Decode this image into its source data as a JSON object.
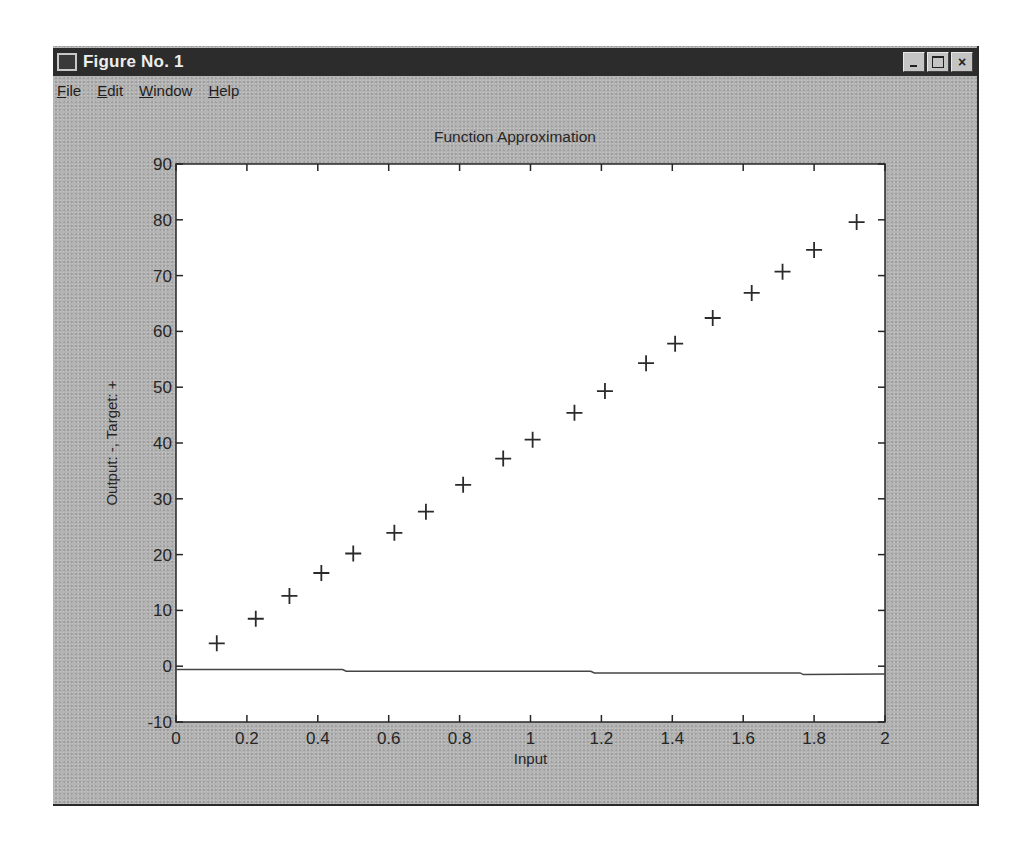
{
  "window": {
    "title": "Figure No. 1",
    "menu": [
      {
        "label": "File",
        "accel": "F"
      },
      {
        "label": "Edit",
        "accel": "E"
      },
      {
        "label": "Window",
        "accel": "W"
      },
      {
        "label": "Help",
        "accel": "H"
      }
    ],
    "buttons": {
      "minimize": "minimize",
      "maximize": "maximize",
      "close": "×"
    }
  },
  "colors": {
    "frame": "#b4b4b4",
    "titlebar": "#2c2c2c",
    "plot_bg": "#ffffff",
    "ink": "#262626"
  },
  "chart_data": {
    "type": "scatter",
    "title": "Function Approximation",
    "xlabel": "Input",
    "ylabel": "Output: -, Target: +",
    "xlim": [
      0,
      2
    ],
    "ylim": [
      -10,
      90
    ],
    "xticks": [
      0,
      0.2,
      0.4,
      0.6,
      0.8,
      1,
      1.2,
      1.4,
      1.6,
      1.8,
      2
    ],
    "xtick_labels": [
      "0",
      "0.2",
      "0.4",
      "0.6",
      "0.8",
      "1",
      "1.2",
      "1.4",
      "1.6",
      "1.8",
      "2"
    ],
    "yticks": [
      -10,
      0,
      10,
      20,
      30,
      40,
      50,
      60,
      70,
      80,
      90
    ],
    "ytick_labels": [
      "-10",
      "0",
      "10",
      "20",
      "30",
      "40",
      "50",
      "60",
      "70",
      "80",
      "90"
    ],
    "grid": false,
    "series": [
      {
        "name": "Target",
        "marker": "+",
        "x": [
          0.115,
          0.225,
          0.32,
          0.41,
          0.5,
          0.616,
          0.705,
          0.81,
          0.923,
          1.006,
          1.124,
          1.21,
          1.326,
          1.408,
          1.514,
          1.624,
          1.711,
          1.8,
          1.92
        ],
        "y": [
          4.1,
          8.5,
          12.6,
          16.7,
          20.2,
          23.9,
          27.7,
          32.5,
          37.2,
          40.6,
          45.4,
          49.3,
          54.3,
          57.8,
          62.4,
          66.9,
          70.7,
          74.6,
          79.6
        ]
      },
      {
        "name": "Output",
        "line": "-",
        "x": [
          0,
          0.47,
          0.48,
          1.17,
          1.18,
          1.76,
          1.77,
          2.0
        ],
        "y": [
          -0.6,
          -0.6,
          -0.9,
          -0.9,
          -1.2,
          -1.2,
          -1.5,
          -1.4
        ]
      }
    ]
  }
}
